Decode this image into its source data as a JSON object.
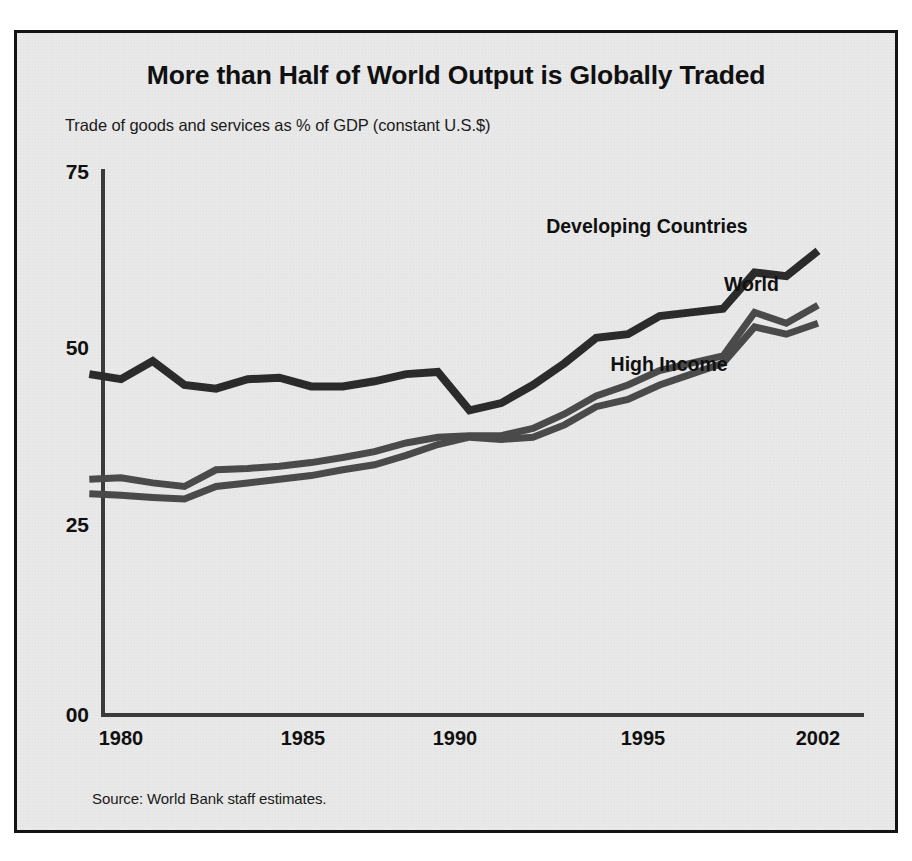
{
  "figure": {
    "title": "More than Half of World Output is Globally Traded",
    "subtitle": "Trade of goods and services as % of GDP (constant U.S.$)",
    "source": "Source: World Bank staff estimates.",
    "background_color": "#e9e9e9",
    "border_color": "#141414",
    "axis_color": "#3b3b3b"
  },
  "labels": {
    "developing": "Developing Countries",
    "world": "World",
    "high_income": "High Income"
  },
  "yticks": [
    "75",
    "50",
    "25",
    "00"
  ],
  "xticks": [
    "1980",
    "1985",
    "1990",
    "1995",
    "2002"
  ],
  "chart_data": {
    "type": "line",
    "title": "More than Half of World Output is Globally Traded",
    "subtitle": "Trade of goods and services as % of GDP (constant U.S.$)",
    "source": "Source: World Bank staff estimates.",
    "xlabel": "",
    "ylabel": "Trade of goods and services as % of GDP (constant U.S.$)",
    "xlim": [
      1979,
      2003
    ],
    "ylim": [
      0,
      75
    ],
    "ytick_values": [
      0,
      25,
      50,
      75
    ],
    "ytick_labels": [
      "00",
      "25",
      "50",
      "75"
    ],
    "xtick_values": [
      1980,
      1985,
      1990,
      1995,
      2002
    ],
    "xtick_labels": [
      "1980",
      "1985",
      "1990",
      "1995",
      "2002"
    ],
    "grid": false,
    "legend_position": "inline-annotations",
    "x": [
      1979,
      1980,
      1981,
      1982,
      1983,
      1984,
      1985,
      1986,
      1987,
      1988,
      1989,
      1990,
      1991,
      1992,
      1993,
      1994,
      1995,
      1996,
      1997,
      1998,
      1999,
      2000,
      2001,
      2002
    ],
    "series": [
      {
        "name": "Developing Countries",
        "color": "#2b2b2b",
        "values": [
          47.0,
          46.3,
          48.8,
          45.5,
          45.0,
          46.3,
          46.5,
          45.3,
          45.3,
          46.0,
          47.0,
          47.3,
          42.0,
          43.0,
          45.5,
          48.5,
          52.0,
          52.5,
          55.0,
          55.5,
          56.0,
          61.0,
          60.5,
          64.0
        ]
      },
      {
        "name": "World",
        "color": "#4a4a4a",
        "values": [
          32.5,
          32.7,
          32.0,
          31.5,
          33.8,
          34.0,
          34.3,
          34.8,
          35.5,
          36.3,
          37.5,
          38.3,
          38.5,
          38.5,
          39.5,
          41.5,
          44.0,
          45.5,
          47.5,
          48.5,
          49.5,
          55.5,
          54.0,
          56.5
        ]
      },
      {
        "name": "High Income",
        "color": "#4a4a4a",
        "values": [
          30.5,
          30.3,
          30.0,
          29.8,
          31.5,
          32.0,
          32.5,
          33.0,
          33.8,
          34.5,
          35.8,
          37.3,
          38.3,
          38.0,
          38.3,
          40.0,
          42.5,
          43.5,
          45.5,
          47.0,
          48.5,
          53.5,
          52.5,
          54.0
        ]
      }
    ],
    "annotations": [
      {
        "text": "Developing Countries",
        "x": 1996.6,
        "y": 66.5
      },
      {
        "text": "World",
        "x": 1999.9,
        "y": 58.5
      },
      {
        "text": "High Income",
        "x": 1997.3,
        "y": 47.5
      }
    ]
  }
}
